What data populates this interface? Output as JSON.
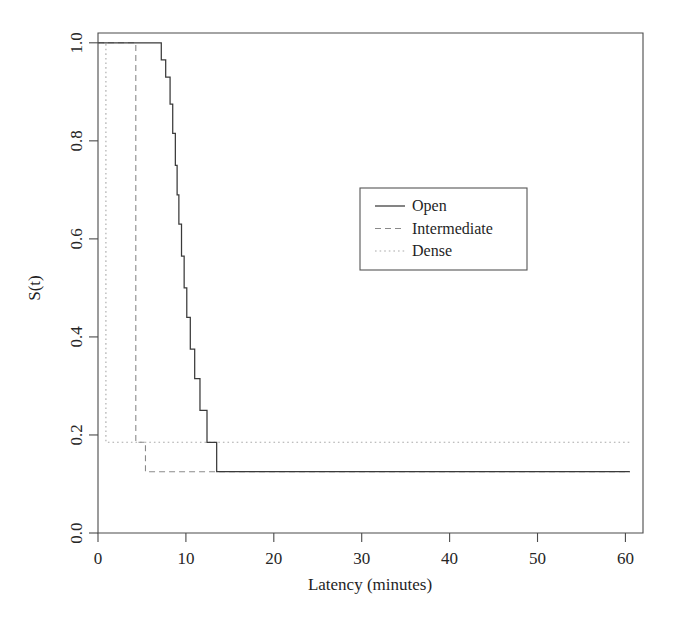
{
  "chart_data": {
    "type": "line",
    "subtype": "kaplan-meier-step",
    "title": "",
    "xlabel": "Latency (minutes)",
    "ylabel": "S(t)",
    "xlim": [
      0,
      62
    ],
    "ylim": [
      0.0,
      1.02
    ],
    "xticks": [
      0,
      10,
      20,
      30,
      40,
      50,
      60
    ],
    "xtick_labels": [
      "0",
      "10",
      "20",
      "30",
      "40",
      "50",
      "60"
    ],
    "yticks": [
      0.0,
      0.2,
      0.4,
      0.6,
      0.8,
      1.0
    ],
    "ytick_labels": [
      "0.0",
      "0.2",
      "0.4",
      "0.6",
      "0.8",
      "1.0"
    ],
    "grid": false,
    "legend_position": "center-right",
    "series": [
      {
        "name": "Open",
        "linestyle": "solid",
        "color": "#3a3a3a",
        "x": [
          0,
          7.2,
          7.2,
          7.7,
          7.7,
          8.2,
          8.2,
          8.5,
          8.5,
          8.8,
          8.8,
          9.0,
          9.0,
          9.2,
          9.2,
          9.5,
          9.5,
          9.8,
          9.8,
          10.1,
          10.1,
          10.5,
          10.5,
          11.0,
          11.0,
          11.6,
          11.6,
          12.4,
          12.4,
          13.5,
          13.5,
          60.5
        ],
        "y": [
          1.0,
          1.0,
          0.965,
          0.965,
          0.93,
          0.93,
          0.875,
          0.875,
          0.815,
          0.815,
          0.75,
          0.75,
          0.69,
          0.69,
          0.63,
          0.63,
          0.565,
          0.565,
          0.5,
          0.5,
          0.44,
          0.44,
          0.375,
          0.375,
          0.315,
          0.315,
          0.25,
          0.25,
          0.185,
          0.185,
          0.125,
          0.125
        ]
      },
      {
        "name": "Intermediate",
        "linestyle": "dashed",
        "color": "#8a8a8a",
        "x": [
          0,
          4.3,
          4.3,
          5.4,
          5.4,
          60.5
        ],
        "y": [
          1.0,
          1.0,
          0.185,
          0.185,
          0.125,
          0.125
        ]
      },
      {
        "name": "Dense",
        "linestyle": "dotted",
        "color": "#a9a9a9",
        "x": [
          0,
          0.9,
          0.9,
          60.5
        ],
        "y": [
          1.0,
          1.0,
          0.185,
          0.185
        ]
      }
    ],
    "plateaus": {
      "open": 0.06,
      "intermediate": 0.125,
      "dense": 0.185
    },
    "legend_entries": [
      {
        "label": "Open",
        "linestyle": "solid"
      },
      {
        "label": "Intermediate",
        "linestyle": "dashed"
      },
      {
        "label": "Dense",
        "linestyle": "dotted"
      }
    ]
  }
}
